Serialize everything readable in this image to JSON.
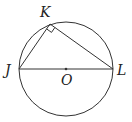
{
  "diagram": {
    "type": "geometry",
    "colors": {
      "stroke": "#333333",
      "background": "#ffffff"
    },
    "circle": {
      "center": "O",
      "cx": 66,
      "cy": 69,
      "r": 47
    },
    "points": {
      "J": {
        "label": "J",
        "x": 19,
        "y": 69
      },
      "K": {
        "label": "K",
        "x": 50,
        "y": 24
      },
      "L": {
        "label": "L",
        "x": 113,
        "y": 69
      },
      "O": {
        "label": "O",
        "x": 66,
        "y": 69
      }
    },
    "segments": [
      "JK",
      "KL",
      "JL"
    ],
    "right_angle_at": "K"
  }
}
